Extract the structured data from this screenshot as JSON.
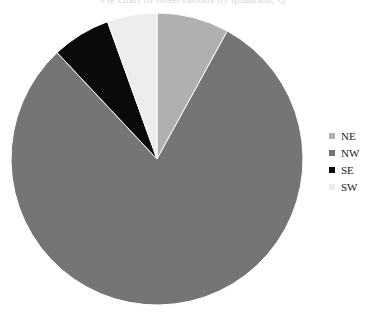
{
  "caption": {
    "clipped_text": "Pie chart of observations by quadrant, Q"
  },
  "legend": {
    "position": "right",
    "items": [
      {
        "label": "NE",
        "color": "#b0b0b0"
      },
      {
        "label": "NW",
        "color": "#757575"
      },
      {
        "label": "SE",
        "color": "#0a0a0a"
      },
      {
        "label": "SW",
        "color": "#ededed"
      }
    ]
  },
  "chart_data": {
    "type": "pie",
    "title": "",
    "xlabel": "",
    "ylabel": "",
    "categories": [
      "NE",
      "NW",
      "SE",
      "SW"
    ],
    "values": [
      8.0,
      80.0,
      6.5,
      5.5
    ],
    "unit": "percent",
    "colors": [
      "#b0b0b0",
      "#757575",
      "#0a0a0a",
      "#ededed"
    ],
    "start_angle_deg": 0,
    "direction": "clockwise",
    "slice_angles_deg": [
      28.8,
      288.0,
      23.4,
      19.8
    ],
    "slice_boundaries_deg": [
      0,
      28.8,
      316.8,
      340.2,
      360
    ],
    "center_px": [
      157,
      159
    ],
    "radius_px": 146,
    "edge_color": "#ffffff",
    "legend_position": "right",
    "grid": false
  }
}
